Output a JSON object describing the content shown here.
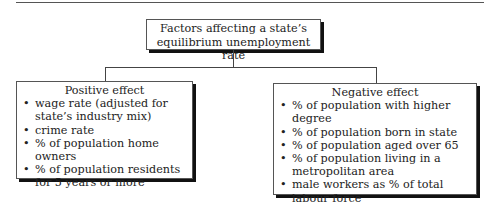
{
  "title": {
    "line1": "Factors affecting a state’s",
    "line2": "equilibrium unemployment rate"
  },
  "positive": {
    "heading": "Positive effect",
    "items": [
      "wage rate (adjusted for state’s industry mix)",
      "crime rate",
      "% of population home owners",
      "% of population residents for 5 years or more"
    ]
  },
  "negative": {
    "heading": "Negative effect",
    "items": [
      "% of population with higher degree",
      "% of population born in state",
      "% of population aged over 65",
      "% of population living in a metropolitan area",
      "male workers as % of total labour force"
    ]
  }
}
